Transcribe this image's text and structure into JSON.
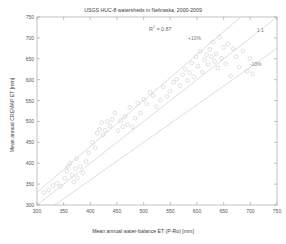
{
  "chart_data": {
    "type": "scatter",
    "title": "USGS HUC-8 watersheds in Nebraska, 2000-2009",
    "xlabel": "Mean annual water-balance ET (P-Ro) [mm]",
    "ylabel": "Mean annual CREMAP ET [mm]",
    "xlim": [
      300,
      750
    ],
    "ylim": [
      300,
      750
    ],
    "xticks": [
      300,
      350,
      400,
      450,
      500,
      550,
      600,
      650,
      700,
      750
    ],
    "yticks": [
      300,
      350,
      400,
      450,
      500,
      550,
      600,
      650,
      700,
      750
    ],
    "xtick_labels": [
      "300",
      "350",
      "400",
      "450",
      "500",
      "550",
      "600",
      "650",
      "700",
      "750"
    ],
    "ytick_labels": [
      "300",
      "350",
      "400",
      "450",
      "500",
      "550",
      "600",
      "650",
      "700",
      "750"
    ],
    "grid": false,
    "legend": "none",
    "marker": "open-circle",
    "marker_color": "#c8c8c8",
    "line_color": "#c0c0c0",
    "axis_color": "#9a9a9a",
    "annotations": [
      {
        "name": "r-squared",
        "text": "R² = 0.87",
        "x": 527,
        "y": 723
      },
      {
        "name": "plus-ten-percent",
        "text": "+10%",
        "x": 600,
        "y": 700
      },
      {
        "name": "one-to-one",
        "text": "1:1",
        "x": 729,
        "y": 720
      },
      {
        "name": "minus-ten-percent",
        "text": "-10%",
        "x": 716,
        "y": 637
      }
    ],
    "reference_lines": [
      {
        "name": "one-to-one-line",
        "label": "1:1",
        "slope": 1.0,
        "intercept": 0
      },
      {
        "name": "plus-ten-percent-line",
        "label": "+10%",
        "slope": 1.1,
        "intercept": 0
      },
      {
        "name": "minus-ten-percent-line",
        "label": "-10%",
        "slope": 0.9,
        "intercept": 0
      }
    ],
    "series": [
      {
        "name": "HUC-8 watersheds",
        "points": [
          [
            313,
            330
          ],
          [
            322,
            336
          ],
          [
            330,
            347
          ],
          [
            338,
            352
          ],
          [
            344,
            345
          ],
          [
            352,
            364
          ],
          [
            356,
            381
          ],
          [
            358,
            392
          ],
          [
            362,
            400
          ],
          [
            366,
            372
          ],
          [
            369,
            355
          ],
          [
            372,
            387
          ],
          [
            374,
            411
          ],
          [
            376,
            365
          ],
          [
            381,
            392
          ],
          [
            386,
            377
          ],
          [
            392,
            404
          ],
          [
            397,
            425
          ],
          [
            404,
            450
          ],
          [
            409,
            437
          ],
          [
            413,
            472
          ],
          [
            417,
            481
          ],
          [
            421,
            497
          ],
          [
            424,
            468
          ],
          [
            428,
            479
          ],
          [
            432,
            500
          ],
          [
            437,
            489
          ],
          [
            441,
            505
          ],
          [
            446,
            520
          ],
          [
            452,
            478
          ],
          [
            457,
            502
          ],
          [
            461,
            487
          ],
          [
            465,
            512
          ],
          [
            470,
            492
          ],
          [
            474,
            534
          ],
          [
            479,
            487
          ],
          [
            484,
            508
          ],
          [
            489,
            544
          ],
          [
            494,
            520
          ],
          [
            500,
            553
          ],
          [
            506,
            542
          ],
          [
            512,
            570
          ],
          [
            518,
            562
          ],
          [
            524,
            535
          ],
          [
            531,
            551
          ],
          [
            537,
            583
          ],
          [
            543,
            560
          ],
          [
            549,
            572
          ],
          [
            556,
            594
          ],
          [
            562,
            601
          ],
          [
            568,
            586
          ],
          [
            573,
            612
          ],
          [
            578,
            625
          ],
          [
            582,
            598
          ],
          [
            586,
            617
          ],
          [
            590,
            640
          ],
          [
            594,
            607
          ],
          [
            598,
            655
          ],
          [
            602,
            632
          ],
          [
            606,
            668
          ],
          [
            610,
            618
          ],
          [
            614,
            648
          ],
          [
            618,
            660
          ],
          [
            621,
            636
          ],
          [
            624,
            672
          ],
          [
            627,
            655
          ],
          [
            630,
            690
          ],
          [
            633,
            644
          ],
          [
            636,
            662
          ],
          [
            639,
            628
          ],
          [
            642,
            702
          ],
          [
            646,
            651
          ],
          [
            650,
            677
          ],
          [
            654,
            638
          ],
          [
            658,
            686
          ],
          [
            663,
            609
          ],
          [
            668,
            674
          ],
          [
            673,
            655
          ],
          [
            679,
            630
          ],
          [
            686,
            668
          ],
          [
            694,
            620
          ],
          [
            699,
            651
          ],
          [
            704,
            614
          ]
        ]
      }
    ]
  },
  "icons": {
    "marker": "open-circle-marker"
  }
}
